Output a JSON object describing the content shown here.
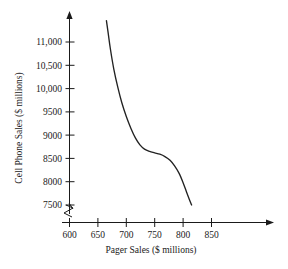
{
  "chart_data": {
    "type": "line",
    "title": "",
    "subtitle": "",
    "xlabel": "Pager Sales ($ millions)",
    "ylabel": "Cell Phone Sales ($ millions)",
    "xlim": [
      600,
      860
    ],
    "ylim": [
      7400,
      11500
    ],
    "grid": false,
    "legend": null,
    "axis_break_y": true,
    "axis_break_x": true,
    "x_ticks": [
      600,
      650,
      700,
      750,
      800,
      850
    ],
    "x_tick_labels": [
      "600",
      "650",
      "700",
      "750",
      "800",
      "850"
    ],
    "y_ticks": [
      7500,
      8000,
      8500,
      9000,
      9500,
      10000,
      10500,
      11000
    ],
    "y_tick_labels": [
      "7500",
      "8000",
      "8500",
      "9000",
      "9500",
      "10,000",
      "10,500",
      "11,000"
    ],
    "series": [
      {
        "name": "Cell Phone Sales",
        "color": "#222222",
        "x": [
          665,
          668,
          672,
          678,
          685,
          692,
          700,
          708,
          716,
          724,
          732,
          741,
          750,
          759,
          768,
          777,
          785,
          793,
          800,
          806,
          811,
          815
        ],
        "y": [
          11460,
          11200,
          10850,
          10420,
          10030,
          9700,
          9400,
          9150,
          8940,
          8790,
          8700,
          8650,
          8620,
          8590,
          8540,
          8460,
          8340,
          8180,
          7980,
          7780,
          7620,
          7500
        ]
      }
    ],
    "annotations": []
  },
  "chart_geometry": {
    "x_axis_pixel_start": 68,
    "x_axis_pixel_end": 210,
    "y_axis_pixel_top": 42,
    "y_axis_pixel_bottom": 205,
    "note": "pixel anchors used for axis placement"
  }
}
